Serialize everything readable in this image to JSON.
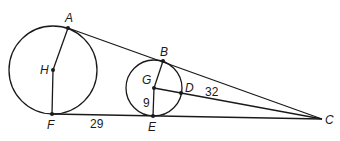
{
  "diagram": {
    "circles": [
      {
        "name": "H",
        "cx": 53,
        "cy": 70,
        "r": 44
      },
      {
        "name": "G",
        "cx": 154,
        "cy": 88,
        "r": 28
      }
    ],
    "points": {
      "A": {
        "label": "A",
        "x": 68,
        "y": 28
      },
      "H": {
        "label": "H",
        "x": 53,
        "y": 70
      },
      "F": {
        "label": "F",
        "x": 52,
        "y": 114
      },
      "B": {
        "label": "B",
        "x": 163,
        "y": 61
      },
      "G": {
        "label": "G",
        "x": 154,
        "y": 88
      },
      "D": {
        "label": "D",
        "x": 181,
        "y": 93
      },
      "E": {
        "label": "E",
        "x": 153,
        "y": 116
      },
      "C": {
        "label": "C",
        "x": 322,
        "y": 119
      }
    },
    "segments": [
      "AC",
      "FC",
      "GC",
      "AH",
      "HF",
      "BG",
      "GE"
    ],
    "measurements": {
      "FE": "29",
      "GE": "9",
      "DC": "32"
    }
  }
}
